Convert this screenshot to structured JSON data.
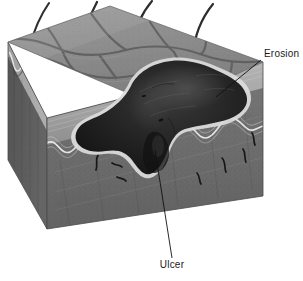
{
  "figure": {
    "background_color": "#ffffff",
    "width": 303,
    "height": 281
  },
  "labels": [
    {
      "id": "erosion",
      "text": "Erosion",
      "x": 264,
      "y": 57,
      "anchor": "start",
      "leader": {
        "x1": 261,
        "y1": 60,
        "x2": 216,
        "y2": 97
      }
    },
    {
      "id": "ulcer",
      "text": "Ulcer",
      "x": 172,
      "y": 268,
      "anchor": "middle",
      "leader": {
        "x1": 172,
        "y1": 258,
        "x2": 155,
        "y2": 150
      }
    }
  ],
  "anatomy": {
    "block": {
      "name": "skin-block",
      "top_face_color": "#8d8d8d",
      "front_face_color": "#6f6f6f",
      "left_face_color": "#5e5e5e",
      "epidermis_band_color": "#a8a8a8",
      "basement_membrane_color": "#e8e8e8",
      "dermis_color": "#6f6f6f"
    },
    "lesion": {
      "name": "ulcer-lesion",
      "fill_color": "#1c1c1c",
      "rim_color": "#d6d6d6",
      "description": "Irregular dark crater penetrating epidermis into dermis"
    },
    "hairs": {
      "name": "hair-shafts",
      "count": 4,
      "color": "#2b2b2b"
    },
    "surface_lines": {
      "name": "skin-cleavage-lines",
      "color": "#5a5a5a"
    },
    "vessels": {
      "name": "dermal-vessels",
      "color": "#1f1f1f",
      "count": 6
    }
  },
  "colors": {
    "label_text": "#1a1a1a",
    "leader_line": "#111111"
  }
}
